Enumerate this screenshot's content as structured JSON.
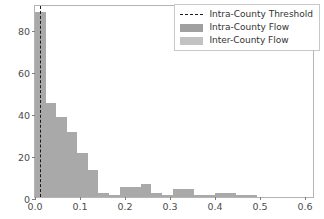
{
  "chart_data": {
    "type": "bar",
    "subtype": "histogram",
    "title": "",
    "xlabel": "",
    "ylabel": "",
    "xlim": [
      0.0,
      0.622
    ],
    "ylim": [
      0,
      92
    ],
    "xticks": [
      0.0,
      0.1,
      0.2,
      0.3,
      0.4,
      0.5,
      0.6
    ],
    "xtick_labels": [
      "0.0",
      "0.1",
      "0.2",
      "0.3",
      "0.4",
      "0.5",
      "0.6"
    ],
    "yticks": [
      0,
      20,
      40,
      60,
      80
    ],
    "ytick_labels": [
      "0",
      "20",
      "40",
      "60",
      "80"
    ],
    "grid": false,
    "legend_position": "upper right",
    "bin_width": 0.0235,
    "bin_edges": [
      0.0,
      0.0235,
      0.047,
      0.0705,
      0.094,
      0.1175,
      0.141,
      0.1645,
      0.188,
      0.2115,
      0.235,
      0.2585,
      0.282,
      0.3055,
      0.329,
      0.3525,
      0.376,
      0.3995,
      0.423,
      0.4465,
      0.47,
      0.4935,
      0.517,
      0.5405,
      0.564,
      0.5875,
      0.611
    ],
    "values": [
      88,
      45,
      38,
      31,
      21,
      13,
      2,
      1,
      5,
      5,
      6,
      2,
      1,
      4,
      4,
      1,
      1,
      2,
      2,
      1,
      1,
      0,
      0,
      0,
      0,
      0
    ],
    "bar_color": "#a9a9a9",
    "threshold_line": {
      "x": 0.012,
      "style": "dashed",
      "color": "#1a1a1a"
    },
    "legend": [
      {
        "label": "Intra-County Threshold",
        "type": "line",
        "style": "dashed",
        "color": "#1a1a1a"
      },
      {
        "label": "Intra-County Flow",
        "type": "patch",
        "color": "#a0a0a0"
      },
      {
        "label": "Inter-County Flow",
        "type": "patch",
        "color": "#c2c2c2"
      }
    ]
  }
}
